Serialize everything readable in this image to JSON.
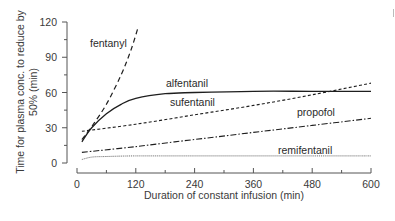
{
  "chart_data": {
    "type": "line",
    "title": "",
    "xlabel": "Duration of constant infusion (min)",
    "ylabel_lines": [
      "Time for plasma conc. to reduce by",
      "50% (min)"
    ],
    "ylabel": "Time for plasma conc. to reduce by 50% (min)",
    "xlim": [
      0,
      600
    ],
    "ylim": [
      0,
      120
    ],
    "xticks": [
      0,
      120,
      240,
      360,
      480,
      600
    ],
    "xticks_minor": [
      60,
      180,
      300,
      420,
      540
    ],
    "yticks": [
      0,
      30,
      60,
      90,
      120
    ],
    "yticks_minor": [
      15,
      45,
      75,
      105
    ],
    "grid": false,
    "legend": "inline labels",
    "series": [
      {
        "name": "fentanyl",
        "style": "dashed-long",
        "x": [
          10,
          30,
          60,
          90,
          110,
          125
        ],
        "y": [
          20,
          31,
          50,
          75,
          96,
          116
        ]
      },
      {
        "name": "alfentanil",
        "style": "solid",
        "x": [
          10,
          30,
          60,
          90,
          120,
          180,
          240,
          360,
          480,
          600
        ],
        "y": [
          18,
          30,
          42,
          50,
          55,
          59,
          60,
          61,
          61,
          61
        ]
      },
      {
        "name": "sufentanil",
        "style": "dashed-short",
        "x": [
          10,
          120,
          240,
          360,
          480,
          600
        ],
        "y": [
          27,
          33,
          41,
          49,
          58,
          68
        ]
      },
      {
        "name": "propofol",
        "style": "dash-dot",
        "x": [
          10,
          120,
          240,
          360,
          480,
          600
        ],
        "y": [
          9,
          14,
          20,
          26,
          32,
          38
        ]
      },
      {
        "name": "remifentanil",
        "style": "dotted",
        "x": [
          10,
          30,
          60,
          120,
          240,
          360,
          480,
          600
        ],
        "y": [
          3,
          5,
          5.5,
          6,
          6,
          6,
          6,
          6
        ]
      }
    ],
    "annotations": [
      {
        "text": "fentanyl",
        "x": 25,
        "y": 100
      },
      {
        "text": "alfentanil",
        "x": 183,
        "y": 67
      },
      {
        "text": "sufentanil",
        "x": 190,
        "y": 51
      },
      {
        "text": "propofol",
        "x": 452,
        "y": 42
      },
      {
        "text": "remifentanil",
        "x": 415,
        "y": 10
      }
    ]
  },
  "labels": {
    "fentanyl": "fentanyl",
    "alfentanil": "alfentanil",
    "sufentanil": "sufentanil",
    "propofol": "propofol",
    "remifentanil": "remifentanil",
    "xlabel": "Duration of constant infusion (min)",
    "ylabel_line1": "Time for plasma conc. to reduce by",
    "ylabel_line2": "50% (min)"
  },
  "ticks": {
    "x": [
      "0",
      "120",
      "240",
      "360",
      "480",
      "600"
    ],
    "y": [
      "0",
      "30",
      "60",
      "90",
      "120"
    ]
  }
}
